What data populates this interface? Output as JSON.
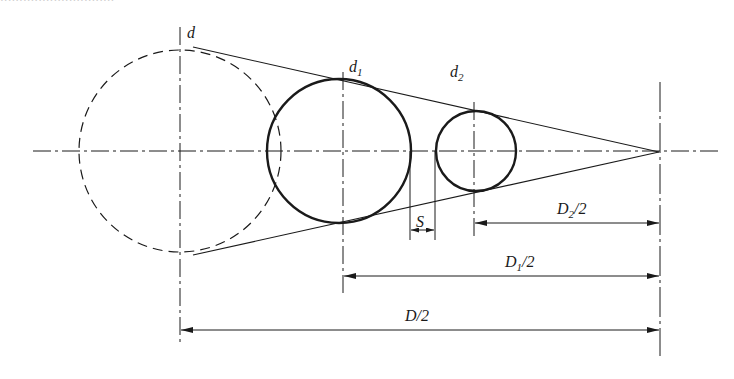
{
  "caption_fragment": "······························",
  "diagram": {
    "stroke_color": "#1a1a1a",
    "labels": {
      "d": "d",
      "d1_main": "d",
      "d1_sub": "1",
      "d2_main": "d",
      "d2_sub": "2",
      "S": "S",
      "D2_main": "D",
      "D2_sub": "2",
      "D2_tail": "/2",
      "D1_main": "D",
      "D1_sub": "1",
      "D1_tail": "/2",
      "D_half": "D/2"
    },
    "circles": [
      {
        "name": "d",
        "cx": 180,
        "cy": 151,
        "r": 101,
        "style": "dashed"
      },
      {
        "name": "d1",
        "cx": 343,
        "cy": 151,
        "r": 72,
        "style": "solid-thick"
      },
      {
        "name": "d2",
        "cx": 476,
        "cy": 151,
        "r": 40,
        "style": "solid-thick"
      }
    ],
    "apex": {
      "x": 659,
      "y": 152
    },
    "dimensions": [
      {
        "name": "S",
        "from_x": 410,
        "to_x": 435,
        "y": 230
      },
      {
        "name": "D2/2",
        "from_x": 474,
        "to_x": 659,
        "y": 223
      },
      {
        "name": "D1/2",
        "from_x": 343,
        "to_x": 659,
        "y": 276
      },
      {
        "name": "D/2",
        "from_x": 180,
        "to_x": 659,
        "y": 330
      }
    ]
  }
}
